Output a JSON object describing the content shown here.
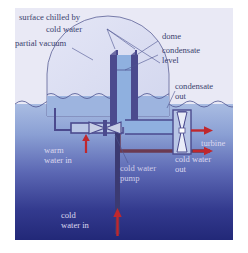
{
  "diagram": {
    "labels": {
      "surface_chilled": "surface chilled by",
      "cold_water_top": "cold water",
      "partial_vacuum": "partial vacuum",
      "dome": "dome",
      "condensate_level": "condensate\nlevel",
      "condensate_out": "condensate\nout",
      "turbine": "turbine",
      "warm_water_in": "warm\nwater in",
      "cold_water_pump": "cold water\npump",
      "cold_water_out": "cold water\nout",
      "cold_water_in": "cold\nwater in"
    },
    "colors": {
      "sky": "#e8e8f4",
      "sea_top": "#9fb4dd",
      "sea_bottom": "#242a7a",
      "pipe_wall": "#4b4a8e",
      "pipe_fill": "#8fb0df",
      "arrow_red": "#c0272d",
      "outline": "#5a5f8e",
      "label_dark": "#3a3f6e",
      "label_light": "#dcd8ef"
    },
    "flow_arrows": [
      {
        "name": "warm-water-in",
        "direction": "up",
        "color": "#c0272d"
      },
      {
        "name": "cold-water-in",
        "direction": "up",
        "color": "#c0272d"
      },
      {
        "name": "condensate-out",
        "direction": "right",
        "color": "#c0272d"
      },
      {
        "name": "cold-water-out",
        "direction": "right",
        "color": "#c0272d"
      }
    ],
    "components": [
      "dome",
      "condensate level",
      "turbine",
      "cold water pump"
    ]
  }
}
